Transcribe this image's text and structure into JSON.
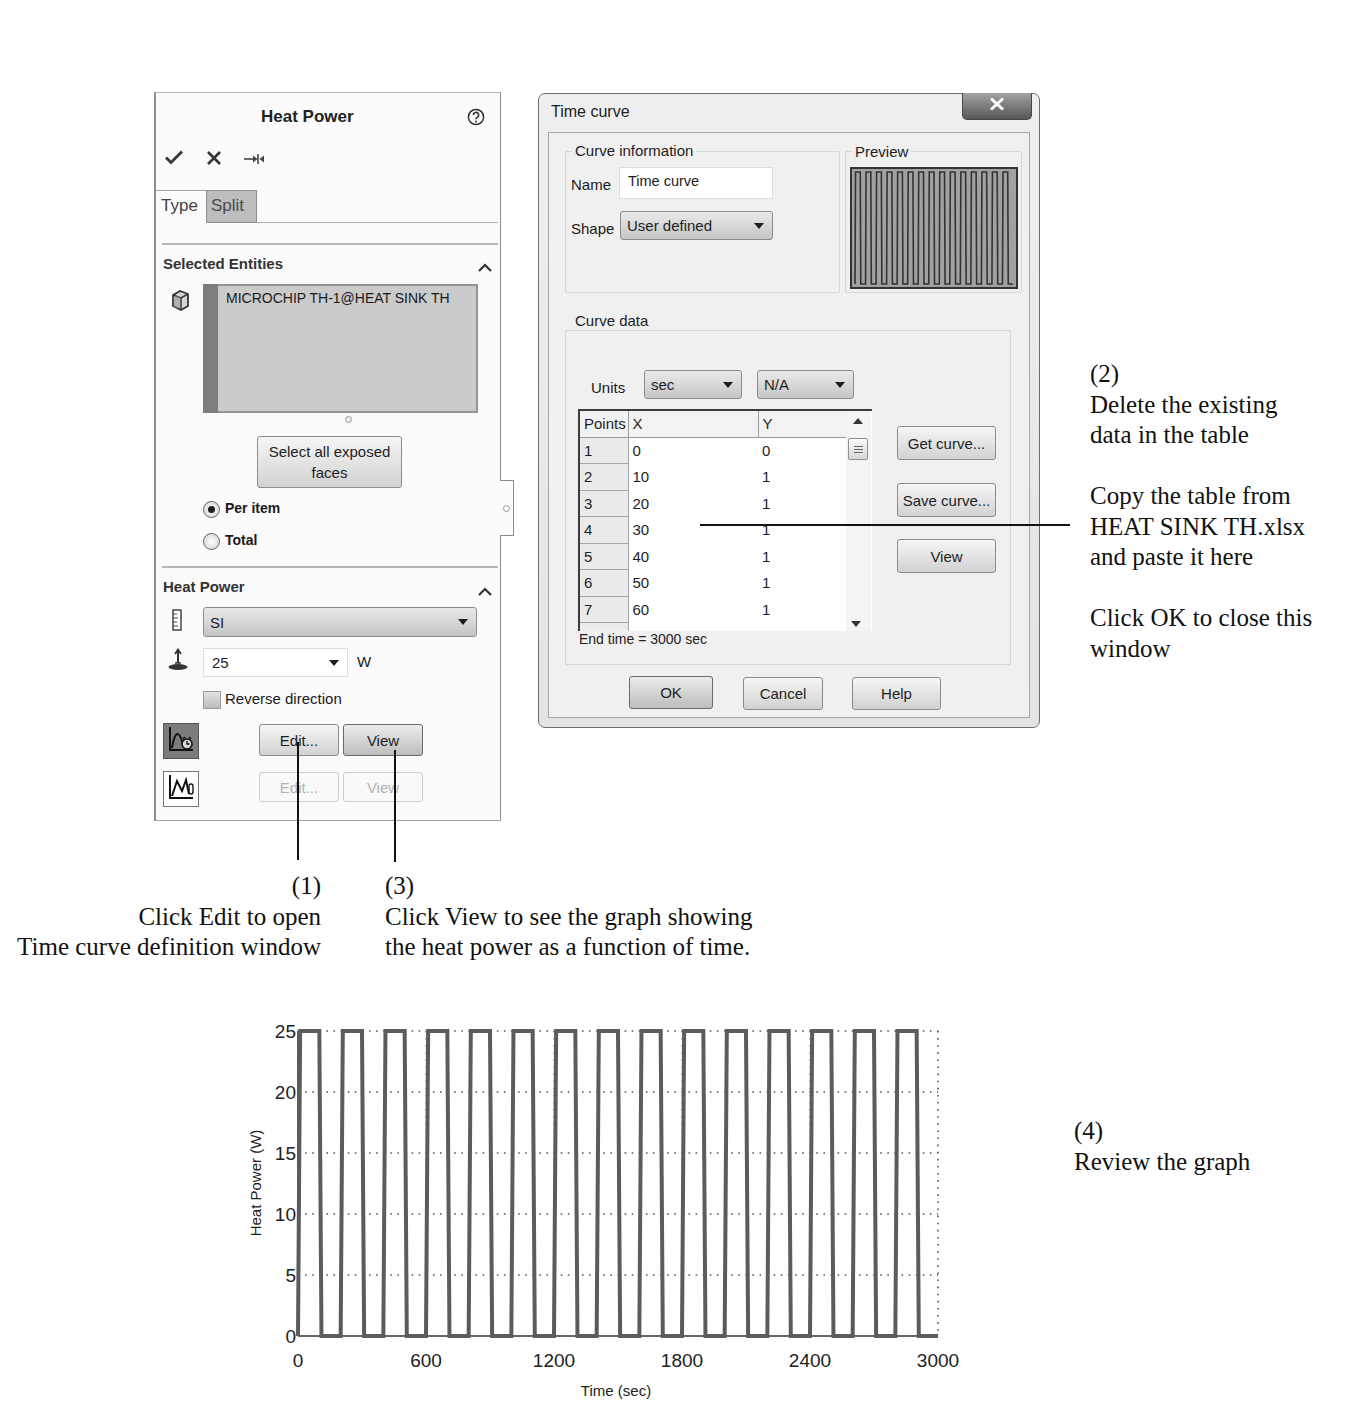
{
  "left_panel": {
    "title": "Heat Power",
    "toolbar_icons": [
      "check-icon",
      "close-icon",
      "pin-icon"
    ],
    "help_icon": "help-icon",
    "tabs": [
      {
        "label": "Type",
        "active": true
      },
      {
        "label": "Split",
        "active": false
      }
    ],
    "selected_entities": {
      "header": "Selected Entities",
      "items": [
        "MICROCHIP TH-1@HEAT SINK TH"
      ],
      "select_all_button": "Select all exposed faces",
      "options": [
        {
          "label": "Per item",
          "selected": true
        },
        {
          "label": "Total",
          "selected": false
        }
      ]
    },
    "heat_power": {
      "header": "Heat Power",
      "unit_system": "SI",
      "value": "25",
      "unit": "W",
      "reverse_direction_label": "Reverse direction",
      "reverse_direction_checked": false,
      "time_curve": {
        "edit": "Edit...",
        "view": "View",
        "enabled": true
      },
      "temperature_curve": {
        "edit": "Edit...",
        "view": "View",
        "enabled": false
      }
    }
  },
  "dialog": {
    "title": "Time curve",
    "curve_information": {
      "label": "Curve information",
      "name_label": "Name",
      "name_value": "Time curve",
      "shape_label": "Shape",
      "shape_value": "User defined"
    },
    "preview_label": "Preview",
    "curve_data": {
      "label": "Curve data",
      "units_label": "Units",
      "x_unit": "sec",
      "y_unit": "N/A",
      "table": {
        "columns": [
          "Points",
          "X",
          "Y"
        ],
        "rows": [
          [
            "1",
            "0",
            "0"
          ],
          [
            "2",
            "10",
            "1"
          ],
          [
            "3",
            "20",
            "1"
          ],
          [
            "4",
            "30",
            "1"
          ],
          [
            "5",
            "40",
            "1"
          ],
          [
            "6",
            "50",
            "1"
          ],
          [
            "7",
            "60",
            "1"
          ]
        ]
      },
      "end_time": "End time = 3000 sec",
      "buttons": {
        "get_curve": "Get curve...",
        "save_curve": "Save curve...",
        "view": "View"
      }
    },
    "footer": {
      "ok": "OK",
      "cancel": "Cancel",
      "help": "Help"
    }
  },
  "annotations": {
    "step1": {
      "lines": [
        "(1)",
        "Click Edit to open",
        "Time curve definition window"
      ]
    },
    "step2": {
      "paragraphs": [
        [
          "(2)",
          "Delete the existing",
          "data in the table"
        ],
        [
          "Copy the table from",
          "HEAT SINK TH.xlsx",
          "and paste it here"
        ],
        [
          "Click OK to close this",
          "window"
        ]
      ]
    },
    "step3": {
      "lines": [
        "(3)",
        "Click View to see the graph showing",
        "the heat power as a function of time."
      ]
    },
    "step4": {
      "lines": [
        "(4)",
        "Review the graph"
      ]
    }
  },
  "chart_data": {
    "type": "line",
    "title": "",
    "xlabel": "Time (sec)",
    "ylabel": "Heat Power (W)",
    "xlim": [
      0,
      3000
    ],
    "ylim": [
      0,
      25
    ],
    "xticks": [
      0,
      600,
      1200,
      1800,
      2400,
      3000
    ],
    "yticks": [
      0,
      5,
      10,
      15,
      20,
      25
    ],
    "grid": true,
    "legend": null,
    "series": [
      {
        "name": "Heat Power",
        "x": [
          0,
          10,
          100,
          110,
          200,
          210,
          300,
          310,
          400,
          410,
          500,
          510,
          600,
          610,
          700,
          710,
          800,
          810,
          900,
          910,
          1000,
          1010,
          1100,
          1110,
          1200,
          1210,
          1300,
          1310,
          1400,
          1410,
          1500,
          1510,
          1600,
          1610,
          1700,
          1710,
          1800,
          1810,
          1900,
          1910,
          2000,
          2010,
          2100,
          2110,
          2200,
          2210,
          2300,
          2310,
          2400,
          2410,
          2500,
          2510,
          2600,
          2610,
          2700,
          2710,
          2800,
          2810,
          2900,
          2910,
          3000
        ],
        "y": [
          0,
          25,
          25,
          0,
          0,
          25,
          25,
          0,
          0,
          25,
          25,
          0,
          0,
          25,
          25,
          0,
          0,
          25,
          25,
          0,
          0,
          25,
          25,
          0,
          0,
          25,
          25,
          0,
          0,
          25,
          25,
          0,
          0,
          25,
          25,
          0,
          0,
          25,
          25,
          0,
          0,
          25,
          25,
          0,
          0,
          25,
          25,
          0,
          0,
          25,
          25,
          0,
          0,
          25,
          25,
          0,
          0,
          25,
          25,
          0,
          0
        ]
      }
    ]
  }
}
